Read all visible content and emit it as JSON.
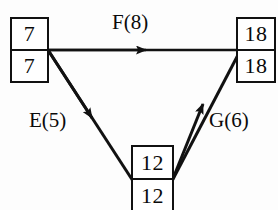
{
  "diagram": {
    "type": "activity-on-arrow network",
    "background_color": "#fdfdfd",
    "stroke_color": "#111111",
    "text_color": "#0a0a0a",
    "nodes": [
      {
        "id": "start",
        "name": "left-node",
        "top_value": "7",
        "bottom_value": "7",
        "position": {
          "x": 10,
          "y": 17,
          "w": 39,
          "h": 66
        }
      },
      {
        "id": "end",
        "name": "right-node",
        "top_value": "18",
        "bottom_value": "18",
        "position": {
          "x": 236,
          "y": 17,
          "w": 40,
          "h": 66
        }
      },
      {
        "id": "mid",
        "name": "bottom-node",
        "top_value": "12",
        "bottom_value": "12",
        "position": {
          "x": 131,
          "y": 145,
          "w": 43,
          "h": 68
        }
      }
    ],
    "edges": [
      {
        "id": "F",
        "label": "F(8)",
        "activity": "F",
        "duration": 8,
        "from": "start",
        "to": "end",
        "direction": "right"
      },
      {
        "id": "E",
        "label": "E(5)",
        "activity": "E",
        "duration": 5,
        "from": "start",
        "to": "mid",
        "direction": "down-right"
      },
      {
        "id": "G",
        "label": "G(6)",
        "activity": "G",
        "duration": 6,
        "from": "mid",
        "to": "end",
        "direction": "up-right"
      }
    ]
  }
}
